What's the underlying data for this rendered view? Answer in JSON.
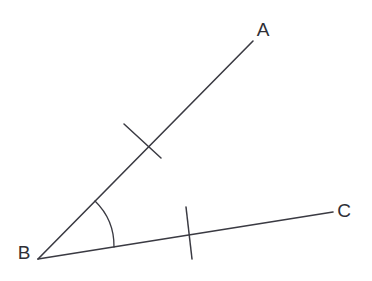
{
  "figure": {
    "background_color": "#ffffff",
    "stroke_color": "#3a3a42",
    "label_color": "#2f2f36",
    "width": 372,
    "height": 281
  },
  "labels": {
    "a": "A",
    "b": "B",
    "c": "C"
  },
  "label_positions": {
    "a": {
      "x": 263,
      "y": 31
    },
    "b": {
      "x": 24,
      "y": 254
    },
    "c": {
      "x": 344,
      "y": 212
    }
  },
  "geometry": {
    "vertex": {
      "x": 38,
      "y": 259
    },
    "ray_ba": {
      "name": "ray-ba",
      "from": {
        "x": 38,
        "y": 259
      },
      "to": {
        "x": 253,
        "y": 41
      },
      "stroke_width": 1.6
    },
    "ray_bc": {
      "name": "ray-bc",
      "from": {
        "x": 38,
        "y": 259
      },
      "to": {
        "x": 333,
        "y": 212
      },
      "stroke_width": 1.6
    },
    "tick_ba": {
      "name": "tick-mark-ba",
      "from": {
        "x": 124,
        "y": 124
      },
      "to": {
        "x": 161,
        "y": 158
      },
      "stroke_width": 1.5
    },
    "tick_bc": {
      "name": "tick-mark-bc",
      "from": {
        "x": 186,
        "y": 207
      },
      "to": {
        "x": 192,
        "y": 259
      },
      "stroke_width": 1.5
    },
    "angle_arc": {
      "name": "angle-arc",
      "path": "M 95 201 A 63 63 0 0 1 114 247",
      "stroke_width": 1.3
    }
  }
}
